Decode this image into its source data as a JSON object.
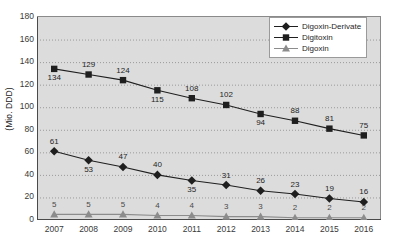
{
  "chart_data": {
    "type": "line",
    "title": "",
    "subtitle": "",
    "xlabel": "",
    "ylabel": "(Mio. DDD)",
    "categories": [
      "2007",
      "2008",
      "2009",
      "2010",
      "2011",
      "2012",
      "2013",
      "2014",
      "2015",
      "2016"
    ],
    "x": [
      2007,
      2008,
      2009,
      2010,
      2011,
      2012,
      2013,
      2014,
      2015,
      2016
    ],
    "ylim": [
      0,
      180
    ],
    "yticks": [
      0,
      20,
      40,
      60,
      80,
      100,
      120,
      140,
      160,
      180
    ],
    "grid": true,
    "grid_style": "dotted-horizontal",
    "legend_position": "top-right",
    "series": [
      {
        "name": "Digoxin-Derivate",
        "marker": "diamond",
        "color": "#1f1f1f",
        "values": [
          61,
          53,
          47,
          40,
          35,
          31,
          26,
          23,
          19,
          16
        ],
        "label_positions": [
          "above",
          "below",
          "above",
          "above",
          "below",
          "above",
          "above",
          "above",
          "above",
          "above"
        ]
      },
      {
        "name": "Digitoxin",
        "marker": "square",
        "color": "#1f1f1f",
        "values": [
          134,
          129,
          124,
          115,
          108,
          102,
          94,
          88,
          81,
          75
        ],
        "label_positions": [
          "below",
          "above",
          "above",
          "below",
          "above",
          "above",
          "below",
          "above",
          "above",
          "above"
        ]
      },
      {
        "name": "Digoxin",
        "marker": "triangle",
        "color": "#8c8c8c",
        "values": [
          5,
          5,
          5,
          4,
          4,
          3,
          3,
          2,
          2,
          2
        ],
        "label_positions": [
          "above",
          "above",
          "above",
          "above",
          "above",
          "above",
          "above",
          "above",
          "above",
          "above"
        ]
      }
    ],
    "colors": {
      "plot_background": "#dcdcdc",
      "page_background": "#ffffff",
      "gridline": "#9a9a9a",
      "axis": "#4a4a4a",
      "series_primary": "#1f1f1f",
      "series_gray": "#8c8c8c"
    }
  }
}
